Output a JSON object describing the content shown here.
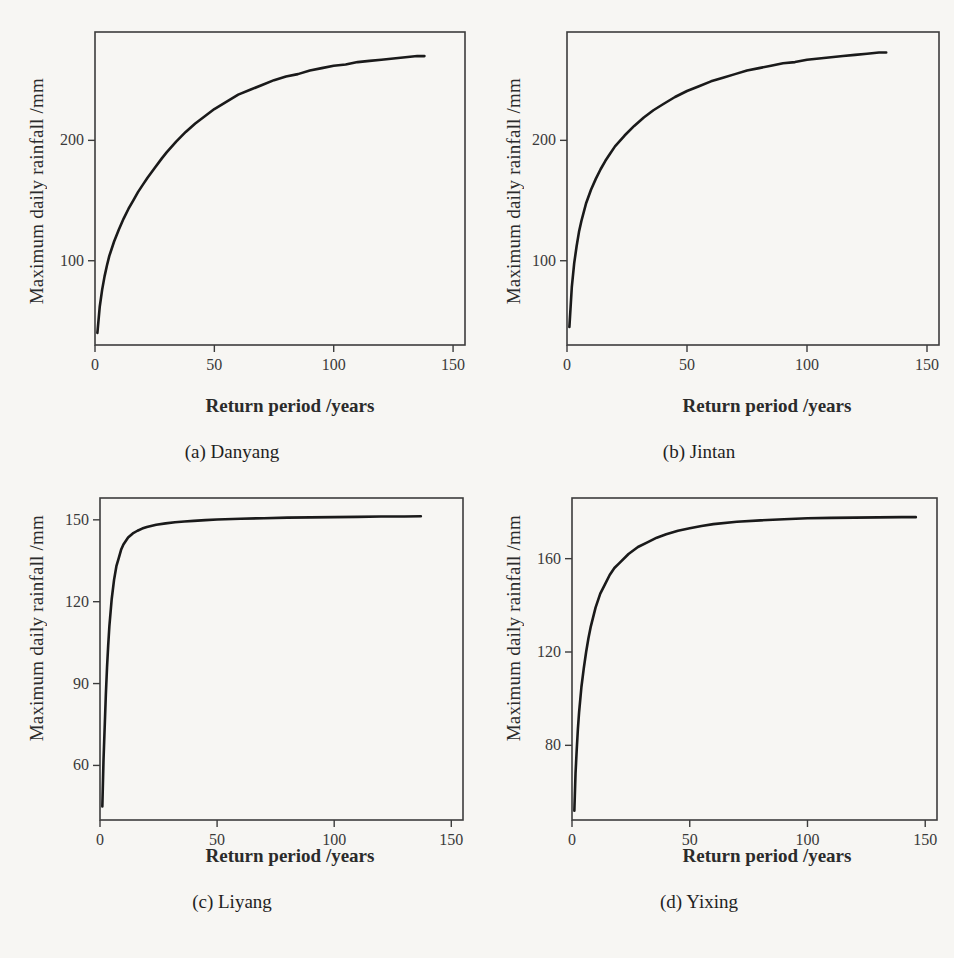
{
  "figure": {
    "panel_count": 4,
    "shared_xlabel": "Return period /years",
    "shared_ylabel": "Maximum daily rainfall /mm"
  },
  "chart_data": [
    {
      "type": "line",
      "panel": "a",
      "caption": "(a) Danyang",
      "title": "",
      "xlabel": "Return period /years",
      "ylabel": "Maximum daily rainfall /mm",
      "xlim": [
        0,
        155
      ],
      "ylim": [
        30,
        290
      ],
      "xticks": [
        0,
        50,
        100,
        150
      ],
      "xticklabels": [
        "0",
        "50",
        "100",
        "150"
      ],
      "yticks": [
        100,
        200
      ],
      "yticklabels": [
        "100",
        "200"
      ],
      "grid": false,
      "legend": "none",
      "series": [
        {
          "name": "Danyang return level curve",
          "x": [
            1,
            2,
            3,
            4,
            5,
            6,
            8,
            10,
            12,
            14,
            16,
            18,
            20,
            22,
            25,
            28,
            30,
            34,
            38,
            42,
            46,
            50,
            55,
            60,
            65,
            70,
            75,
            80,
            85,
            90,
            95,
            100,
            105,
            110,
            115,
            120,
            125,
            130,
            135,
            138
          ],
          "y": [
            40,
            62,
            76,
            87,
            96,
            104,
            116,
            126,
            135,
            143,
            150,
            157,
            163,
            169,
            177,
            185,
            190,
            199,
            207,
            214,
            220,
            226,
            232,
            238,
            242,
            246,
            250,
            253,
            255,
            258,
            260,
            262,
            263,
            265,
            266,
            267,
            268,
            269,
            270,
            270
          ]
        }
      ]
    },
    {
      "type": "line",
      "panel": "b",
      "caption": "(b) Jintan",
      "title": "",
      "xlabel": "Return period /years",
      "ylabel": "Maximum daily rainfall /mm",
      "xlim": [
        0,
        155
      ],
      "ylim": [
        30,
        290
      ],
      "xticks": [
        0,
        50,
        100,
        150
      ],
      "xticklabels": [
        "0",
        "50",
        "100",
        "150"
      ],
      "yticks": [
        100,
        200
      ],
      "yticklabels": [
        "100",
        "200"
      ],
      "grid": false,
      "legend": "none",
      "series": [
        {
          "name": "Jintan return level curve",
          "x": [
            1,
            2,
            3,
            4,
            5,
            6,
            8,
            10,
            12,
            14,
            16,
            18,
            20,
            24,
            28,
            32,
            36,
            40,
            45,
            50,
            55,
            60,
            65,
            70,
            75,
            80,
            85,
            90,
            95,
            100,
            105,
            110,
            115,
            120,
            125,
            130,
            133
          ],
          "y": [
            45,
            78,
            98,
            112,
            124,
            133,
            148,
            159,
            168,
            176,
            183,
            189,
            195,
            204,
            212,
            219,
            225,
            230,
            236,
            241,
            245,
            249,
            252,
            255,
            258,
            260,
            262,
            264,
            265,
            267,
            268,
            269,
            270,
            271,
            272,
            273,
            273
          ]
        }
      ]
    },
    {
      "type": "line",
      "panel": "c",
      "caption": "(c) Liyang",
      "title": "",
      "xlabel": "Return period /years",
      "ylabel": "Maximum daily rainfall /mm",
      "xlim": [
        0,
        155
      ],
      "ylim": [
        40,
        158
      ],
      "xticks": [
        0,
        50,
        100,
        150
      ],
      "xticklabels": [
        "0",
        "50",
        "100",
        "150"
      ],
      "yticks": [
        60,
        90,
        120,
        150
      ],
      "yticklabels": [
        "60",
        "90",
        "120",
        "150"
      ],
      "grid": false,
      "legend": "none",
      "series": [
        {
          "name": "Liyang return level curve",
          "x": [
            1,
            1.5,
            2,
            2.5,
            3,
            3.5,
            4,
            5,
            6,
            7,
            8,
            9,
            10,
            12,
            14,
            16,
            18,
            20,
            24,
            28,
            32,
            36,
            40,
            45,
            50,
            60,
            70,
            80,
            90,
            100,
            110,
            120,
            130,
            137
          ],
          "y": [
            45,
            62,
            74,
            86,
            96,
            104,
            111,
            121,
            128,
            133,
            136,
            139,
            141,
            143.5,
            145,
            146,
            146.8,
            147.4,
            148.2,
            148.7,
            149.1,
            149.4,
            149.6,
            149.9,
            150.1,
            150.4,
            150.6,
            150.8,
            150.9,
            151,
            151.1,
            151.2,
            151.2,
            151.3
          ]
        }
      ]
    },
    {
      "type": "line",
      "panel": "d",
      "caption": "(d) Yixing",
      "title": "",
      "xlabel": "Return period /years",
      "ylabel": "Maximum daily rainfall /mm",
      "xlim": [
        0,
        155
      ],
      "ylim": [
        48,
        186
      ],
      "xticks": [
        0,
        50,
        100,
        150
      ],
      "xticklabels": [
        "0",
        "50",
        "100",
        "150"
      ],
      "yticks": [
        80,
        120,
        160
      ],
      "yticklabels": [
        "80",
        "120",
        "160"
      ],
      "grid": false,
      "legend": "none",
      "series": [
        {
          "name": "Yixing return level curve",
          "x": [
            1,
            1.5,
            2,
            2.5,
            3,
            4,
            5,
            6,
            7,
            8,
            10,
            12,
            14,
            16,
            18,
            20,
            24,
            28,
            32,
            36,
            40,
            45,
            50,
            55,
            60,
            70,
            80,
            90,
            100,
            110,
            120,
            130,
            140,
            146
          ],
          "y": [
            52,
            68,
            78,
            87,
            94,
            105,
            113,
            120,
            126,
            131,
            139,
            145,
            149,
            153,
            156,
            158,
            162,
            165,
            167,
            169,
            170.5,
            172,
            173,
            174,
            174.8,
            175.8,
            176.4,
            176.9,
            177.3,
            177.5,
            177.6,
            177.7,
            177.8,
            177.8
          ]
        }
      ]
    }
  ]
}
